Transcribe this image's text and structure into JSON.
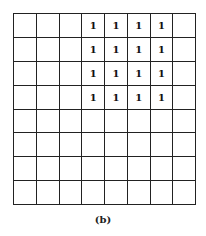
{
  "figure": {
    "caption": "(b)",
    "rows": 8,
    "cols": 8,
    "cells": [
      [
        "",
        "",
        "",
        "1",
        "1",
        "1",
        "1",
        ""
      ],
      [
        "",
        "",
        "",
        "1",
        "1",
        "1",
        "1",
        ""
      ],
      [
        "",
        "",
        "",
        "1",
        "1",
        "1",
        "1",
        ""
      ],
      [
        "",
        "",
        "",
        "1",
        "1",
        "1",
        "1",
        ""
      ],
      [
        "",
        "",
        "",
        "",
        "",
        "",
        "",
        ""
      ],
      [
        "",
        "",
        "",
        "",
        "",
        "",
        "",
        ""
      ],
      [
        "",
        "",
        "",
        "",
        "",
        "",
        "",
        ""
      ],
      [
        "",
        "",
        "",
        "",
        "",
        "",
        "",
        ""
      ]
    ]
  }
}
